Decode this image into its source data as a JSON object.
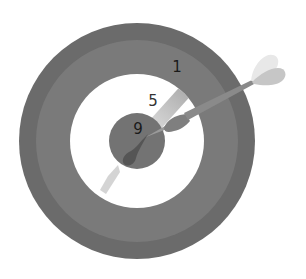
{
  "illustration": {
    "subject": "dartboard-with-dart",
    "board": {
      "center": [
        137,
        141
      ],
      "rings": [
        {
          "name": "outer-ring",
          "radius": 118,
          "color": "#6b6b6b"
        },
        {
          "name": "middle-ring",
          "radius": 101,
          "color": "#7a7a7a"
        },
        {
          "name": "inner-white-ring",
          "radius": 67,
          "color": "#ffffff"
        },
        {
          "name": "bullseye",
          "radius": 28,
          "color": "#737373"
        }
      ]
    },
    "labels": [
      {
        "name": "score-1-label",
        "text": "1",
        "x": 177,
        "y": 67,
        "zone": "middle-ring"
      },
      {
        "name": "score-5-label",
        "text": "5",
        "x": 153,
        "y": 101,
        "zone": "inner-white-ring"
      },
      {
        "name": "score-9-label",
        "text": "9",
        "x": 138,
        "y": 129,
        "zone": "bullseye"
      }
    ],
    "dart": {
      "tip": [
        140,
        137
      ],
      "barrel_color": "#7f7f7f",
      "shaft_color": "#8a8a8a",
      "flight_light_color": "#e8e8e8",
      "flight_dark_color": "#c6c6c6",
      "impact_shadow_color": "#555555",
      "trail_color": "#bdbdbd"
    }
  }
}
